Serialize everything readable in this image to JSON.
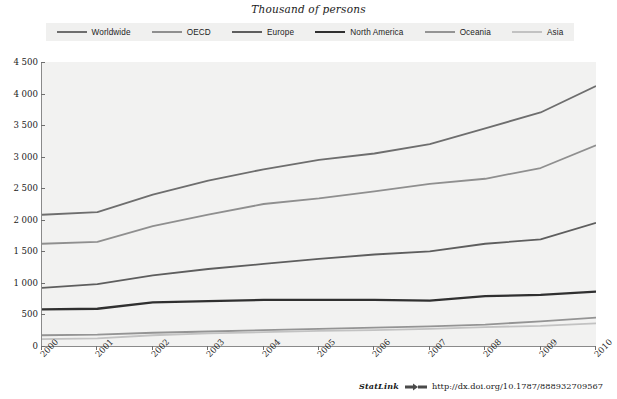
{
  "chart_data": {
    "type": "line",
    "title": "Thousand of persons",
    "xlabel": "",
    "ylabel": "",
    "x": [
      2000,
      2001,
      2002,
      2003,
      2004,
      2005,
      2006,
      2007,
      2008,
      2009,
      2010
    ],
    "xtick_labels": [
      "2000",
      "2001",
      "2002",
      "2003",
      "2004",
      "2005",
      "2006",
      "2007",
      "2008",
      "2009",
      "2010"
    ],
    "ytick_labels": [
      "0",
      "500",
      "1 000",
      "1 500",
      "2 000",
      "2 500",
      "3 000",
      "3 500",
      "4 000",
      "4 500"
    ],
    "yticks": [
      0,
      500,
      1000,
      1500,
      2000,
      2500,
      3000,
      3500,
      4000,
      4500
    ],
    "ylim": [
      0,
      4500
    ],
    "xlim": [
      2000,
      2010
    ],
    "grid": false,
    "legend_position": "top",
    "series": [
      {
        "name": "Worldwide",
        "color": "#6e6e6e",
        "width": 1.8,
        "values": [
          2080,
          2120,
          2400,
          2620,
          2800,
          2950,
          3050,
          3200,
          3450,
          3700,
          4120
        ]
      },
      {
        "name": "OECD",
        "color": "#8f8f8f",
        "width": 1.8,
        "values": [
          1620,
          1650,
          1900,
          2080,
          2250,
          2340,
          2450,
          2570,
          2650,
          2820,
          3180
        ]
      },
      {
        "name": "Europe",
        "color": "#5e5e5e",
        "width": 1.8,
        "values": [
          920,
          980,
          1120,
          1220,
          1300,
          1380,
          1450,
          1500,
          1620,
          1690,
          1950
        ]
      },
      {
        "name": "North America",
        "color": "#303030",
        "width": 2.3,
        "values": [
          580,
          590,
          690,
          710,
          730,
          730,
          730,
          720,
          790,
          810,
          860
        ]
      },
      {
        "name": "Oceania",
        "color": "#949494",
        "width": 1.8,
        "values": [
          170,
          180,
          210,
          230,
          250,
          270,
          290,
          310,
          340,
          390,
          450
        ]
      },
      {
        "name": "Asia",
        "color": "#c2c2c2",
        "width": 1.8,
        "values": [
          110,
          120,
          170,
          200,
          220,
          240,
          250,
          270,
          300,
          320,
          360
        ]
      }
    ]
  },
  "legend": {
    "items": [
      {
        "label": "Worldwide"
      },
      {
        "label": "OECD"
      },
      {
        "label": "Europe"
      },
      {
        "label": "North America"
      },
      {
        "label": "Oceania"
      },
      {
        "label": "Asia"
      }
    ]
  },
  "footer": {
    "statlink_word": "StatLink",
    "url": "http://dx.doi.org/10.1787/888932709567"
  },
  "colors": {
    "plot_background": "#f2f2f1",
    "legend_background": "#f0f0ef",
    "axis": "#8a8a8a",
    "page_background": "#ffffff"
  }
}
